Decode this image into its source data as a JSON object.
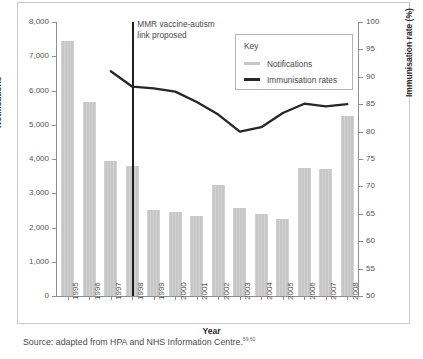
{
  "figure": {
    "source_text": "Source: adapted from HPA and NHS Information Centre.",
    "source_reference": "59,60"
  },
  "annotation": {
    "text": "MMR vaccine-autism\nlink proposed",
    "at_year": "1998"
  },
  "legend": {
    "title": "Key",
    "items": [
      {
        "label": "Notifications",
        "color": "#c6c6c6",
        "type": "bar"
      },
      {
        "label": "Immunisation rates",
        "color": "#272727",
        "type": "line"
      }
    ]
  },
  "chart_data": {
    "type": "bar",
    "title": "",
    "xlabel": "Year",
    "ylabel": "Notifications",
    "y2label": "Immunisation rate (%)",
    "categories": [
      "1995",
      "1996",
      "1997",
      "1998",
      "1999",
      "2000",
      "2001",
      "2002",
      "2003",
      "2004",
      "2005",
      "2006",
      "2007",
      "2008"
    ],
    "ylim": [
      0,
      8000
    ],
    "yticks": [
      "0",
      "1,000",
      "2,000",
      "3,000",
      "4,000",
      "5,000",
      "6,000",
      "7,000",
      "8,000"
    ],
    "ytick_values": [
      0,
      1000,
      2000,
      3000,
      4000,
      5000,
      6000,
      7000,
      8000
    ],
    "y2lim": [
      50,
      100
    ],
    "y2ticks": [
      "50",
      "55",
      "60",
      "65",
      "70",
      "75",
      "80",
      "85",
      "90",
      "95",
      "100"
    ],
    "y2tick_values": [
      50,
      55,
      60,
      65,
      70,
      75,
      80,
      85,
      90,
      95,
      100
    ],
    "grid": false,
    "legend_position": "top-right",
    "series": [
      {
        "name": "Notifications",
        "type": "bar",
        "axis": "left",
        "color": "#c6c6c6",
        "values": [
          7450,
          5680,
          3950,
          3800,
          2500,
          2450,
          2350,
          3230,
          2570,
          2390,
          2250,
          3740,
          3720,
          5250
        ]
      },
      {
        "name": "Immunisation rates",
        "type": "line",
        "axis": "right",
        "color": "#272727",
        "x": [
          "1997",
          "1998",
          "1999",
          "2000",
          "2001",
          "2002",
          "2003",
          "2004",
          "2005",
          "2006",
          "2007",
          "2008"
        ],
        "values": [
          91.0,
          88.2,
          87.9,
          87.3,
          85.4,
          83.1,
          80.0,
          80.8,
          83.4,
          85.1,
          84.6,
          85.0
        ]
      }
    ]
  }
}
